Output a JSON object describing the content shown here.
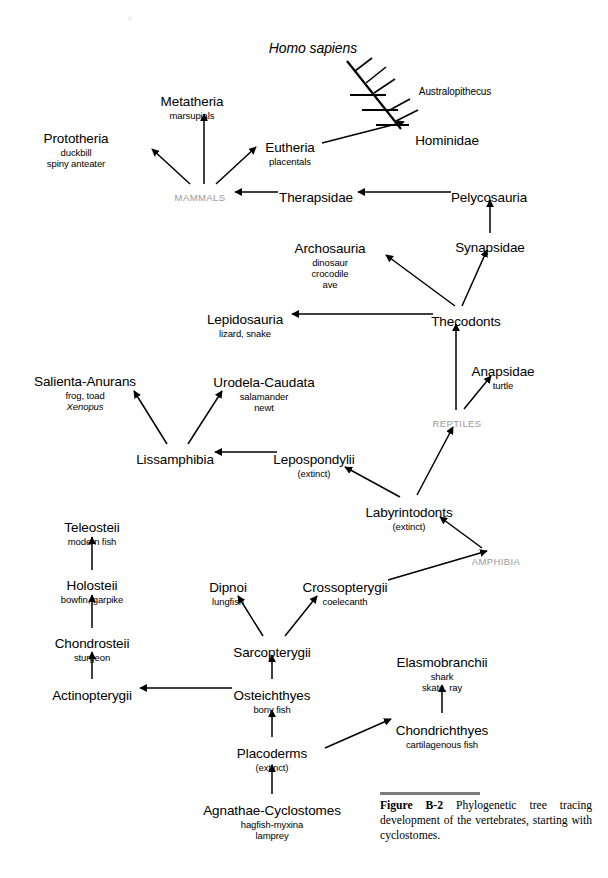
{
  "figure": {
    "label": "Figure",
    "number": "B-2",
    "caption": "Phylogenetic tree tracing development of the vertebrates, starting with cyclostomes."
  },
  "nodes": [
    {
      "id": "homo_sapiens",
      "taxon": "Homo sapiens",
      "common": "",
      "italic_taxon": true,
      "x": 313,
      "y": 40,
      "kind": "sci"
    },
    {
      "id": "australopithecus",
      "taxon": "Australopithecus",
      "common": "",
      "x": 455,
      "y": 86,
      "kind": "small"
    },
    {
      "id": "hominidae",
      "taxon": "Hominidae",
      "common": "",
      "x": 447,
      "y": 133
    },
    {
      "id": "metatheria",
      "taxon": "Metatheria",
      "common": "marsupials",
      "x": 192,
      "y": 94
    },
    {
      "id": "prototheria",
      "taxon": "Prototheria",
      "common": "duckbill\nspiny anteater",
      "x": 76,
      "y": 131
    },
    {
      "id": "eutheria",
      "taxon": "Eutheria",
      "common": "placentals",
      "x": 290,
      "y": 140
    },
    {
      "id": "mammals",
      "taxon": "MAMMALS",
      "common": "",
      "x": 200,
      "y": 192,
      "kind": "group"
    },
    {
      "id": "therapsidae",
      "taxon": "Therapsidae",
      "common": "",
      "x": 316,
      "y": 190
    },
    {
      "id": "pelycosauria",
      "taxon": "Pelycosauria",
      "common": "",
      "x": 489,
      "y": 190
    },
    {
      "id": "synapsidae",
      "taxon": "Synapsidae",
      "common": "",
      "x": 490,
      "y": 240
    },
    {
      "id": "archosauria",
      "taxon": "Archosauria",
      "common": "dinosaur\ncrocodile\nave",
      "x": 330,
      "y": 241
    },
    {
      "id": "thecodonts",
      "taxon": "Thecodonts",
      "common": "",
      "x": 466,
      "y": 314
    },
    {
      "id": "lepidosauria",
      "taxon": "Lepidosauria",
      "common": "lizard, snake",
      "x": 245,
      "y": 312
    },
    {
      "id": "anapsidae",
      "taxon": "Anapsidae",
      "common": "turtle",
      "x": 503,
      "y": 364
    },
    {
      "id": "reptiles",
      "taxon": "REPTILES",
      "common": "",
      "x": 457,
      "y": 418,
      "kind": "group"
    },
    {
      "id": "salienta",
      "taxon": "Salienta-Anurans",
      "common": "frog, toad",
      "common2": "Xenopus",
      "common2_italic": true,
      "x": 85,
      "y": 374
    },
    {
      "id": "urodela",
      "taxon": "Urodela-Caudata",
      "common": "salamander\nnewt",
      "x": 264,
      "y": 375
    },
    {
      "id": "lissamphibia",
      "taxon": "Lissamphibia",
      "common": "",
      "x": 175,
      "y": 452
    },
    {
      "id": "lepospondylii",
      "taxon": "Lepospondylii",
      "common": "(extinct)",
      "x": 314,
      "y": 452
    },
    {
      "id": "labyrintodonts",
      "taxon": "Labyrintodonts",
      "common": "(extinct)",
      "x": 409,
      "y": 505
    },
    {
      "id": "amphibia",
      "taxon": "AMPHIBIA",
      "common": "",
      "x": 496,
      "y": 556,
      "kind": "group"
    },
    {
      "id": "teleosteii",
      "taxon": "Teleosteii",
      "common": "modern fish",
      "x": 92,
      "y": 520
    },
    {
      "id": "holosteii",
      "taxon": "Holosteii",
      "common": "bowfin, garpike",
      "x": 92,
      "y": 578
    },
    {
      "id": "chondrosteii",
      "taxon": "Chondrosteii",
      "common": "sturgeon",
      "x": 92,
      "y": 636
    },
    {
      "id": "actinopterygii",
      "taxon": "Actinopterygii",
      "common": "",
      "x": 92,
      "y": 688
    },
    {
      "id": "dipnoi",
      "taxon": "Dipnoi",
      "common": "lungfish",
      "x": 228,
      "y": 580
    },
    {
      "id": "crossopterygii",
      "taxon": "Crossopterygii",
      "common": "coelecanth",
      "x": 345,
      "y": 580
    },
    {
      "id": "sarcopterygii",
      "taxon": "Sarcopterygii",
      "common": "",
      "x": 272,
      "y": 645
    },
    {
      "id": "osteichthyes",
      "taxon": "Osteichthyes",
      "common": "bony fish",
      "x": 272,
      "y": 688
    },
    {
      "id": "elasmobranchii",
      "taxon": "Elasmobranchii",
      "common": "shark\nskate, ray",
      "x": 442,
      "y": 655
    },
    {
      "id": "chondrichthyes",
      "taxon": "Chondrichthyes",
      "common": "cartilagenous fish",
      "x": 442,
      "y": 723
    },
    {
      "id": "placoderms",
      "taxon": "Placoderms",
      "common": "(extinct)",
      "x": 272,
      "y": 746
    },
    {
      "id": "agnathae",
      "taxon": "Agnathae-Cyclostomes",
      "common": "hagfish-myxina\nlamprey",
      "x": 272,
      "y": 803
    }
  ],
  "edges": [
    {
      "name": "mammals-to-prototheria",
      "from": "mammals",
      "to": "prototheria",
      "x1": 190,
      "y1": 184,
      "x2": 152,
      "y2": 149
    },
    {
      "name": "mammals-to-metatheria",
      "from": "mammals",
      "to": "metatheria",
      "x1": 204,
      "y1": 184,
      "x2": 204,
      "y2": 114
    },
    {
      "name": "mammals-to-eutheria",
      "from": "mammals",
      "to": "eutheria",
      "x1": 216,
      "y1": 184,
      "x2": 256,
      "y2": 147
    },
    {
      "name": "therapsidae-to-mammals",
      "from": "therapsidae",
      "to": "mammals",
      "x1": 278,
      "y1": 192,
      "x2": 235,
      "y2": 192
    },
    {
      "name": "pelycosauria-to-therapsidae",
      "from": "pelycosauria",
      "to": "therapsidae",
      "x1": 451,
      "y1": 192,
      "x2": 358,
      "y2": 192
    },
    {
      "name": "eutheria-to-hominidae",
      "from": "eutheria",
      "to": "hominidae",
      "x1": 322,
      "y1": 143,
      "x2": 404,
      "y2": 122
    },
    {
      "name": "synapsidae-to-pelycosauria",
      "from": "synapsidae",
      "to": "pelycosauria",
      "x1": 490,
      "y1": 233,
      "x2": 490,
      "y2": 200
    },
    {
      "name": "thecodonts-to-synapsidae",
      "from": "thecodonts",
      "to": "synapsidae",
      "x1": 462,
      "y1": 306,
      "x2": 487,
      "y2": 250
    },
    {
      "name": "thecodonts-to-archosauria",
      "from": "thecodonts",
      "to": "archosauria",
      "x1": 455,
      "y1": 306,
      "x2": 386,
      "y2": 255
    },
    {
      "name": "thecodonts-to-lepidosauria",
      "from": "thecodonts",
      "to": "lepidosauria",
      "x1": 433,
      "y1": 314,
      "x2": 292,
      "y2": 314
    },
    {
      "name": "reptiles-to-thecodonts",
      "from": "reptiles",
      "to": "thecodonts",
      "x1": 456,
      "y1": 410,
      "x2": 456,
      "y2": 324
    },
    {
      "name": "reptiles-to-anapsidae",
      "from": "reptiles",
      "to": "anapsidae",
      "x1": 464,
      "y1": 409,
      "x2": 491,
      "y2": 376
    },
    {
      "name": "labyrintodonts-to-reptiles",
      "from": "labyrintodonts",
      "to": "reptiles",
      "x1": 417,
      "y1": 495,
      "x2": 453,
      "y2": 427
    },
    {
      "name": "labyrintodonts-to-lepospondylii",
      "from": "labyrintodonts",
      "to": "lepospondylii",
      "x1": 400,
      "y1": 497,
      "x2": 345,
      "y2": 467
    },
    {
      "name": "lepospondylii-to-lissamphibia",
      "from": "lepospondylii",
      "to": "lissamphibia",
      "x1": 277,
      "y1": 452,
      "x2": 215,
      "y2": 452
    },
    {
      "name": "lissamphibia-to-salienta",
      "from": "lissamphibia",
      "to": "salienta",
      "x1": 167,
      "y1": 444,
      "x2": 134,
      "y2": 391
    },
    {
      "name": "lissamphibia-to-urodela",
      "from": "lissamphibia",
      "to": "urodela",
      "x1": 188,
      "y1": 444,
      "x2": 222,
      "y2": 391
    },
    {
      "name": "amphibia-to-labyrintodonts",
      "from": "amphibia",
      "to": "labyrintodonts",
      "x1": 482,
      "y1": 548,
      "x2": 440,
      "y2": 517
    },
    {
      "name": "crossopterygii-to-amphibia",
      "from": "crossopterygii",
      "to": "amphibia",
      "x1": 388,
      "y1": 580,
      "x2": 487,
      "y2": 551
    },
    {
      "name": "sarcopterygii-to-dipnoi",
      "from": "sarcopterygii",
      "to": "dipnoi",
      "x1": 263,
      "y1": 636,
      "x2": 238,
      "y2": 596
    },
    {
      "name": "sarcopterygii-to-crossopterygii",
      "from": "sarcopterygii",
      "to": "crossopterygii",
      "x1": 285,
      "y1": 636,
      "x2": 317,
      "y2": 596
    },
    {
      "name": "osteichthyes-to-sarcopterygii",
      "from": "osteichthyes",
      "to": "sarcopterygii",
      "x1": 272,
      "y1": 679,
      "x2": 272,
      "y2": 655
    },
    {
      "name": "osteichthyes-to-actinopterygii",
      "from": "osteichthyes",
      "to": "actinopterygii",
      "x1": 232,
      "y1": 688,
      "x2": 140,
      "y2": 688
    },
    {
      "name": "actinopterygii-to-chondrosteii",
      "from": "actinopterygii",
      "to": "chondrosteii",
      "x1": 92,
      "y1": 679,
      "x2": 92,
      "y2": 652
    },
    {
      "name": "chondrosteii-to-holosteii",
      "from": "chondrosteii",
      "to": "holosteii",
      "x1": 92,
      "y1": 628,
      "x2": 92,
      "y2": 595
    },
    {
      "name": "holosteii-to-teleosteii",
      "from": "holosteii",
      "to": "teleosteii",
      "x1": 92,
      "y1": 570,
      "x2": 92,
      "y2": 537
    },
    {
      "name": "placoderms-to-osteichthyes",
      "from": "placoderms",
      "to": "osteichthyes",
      "x1": 272,
      "y1": 737,
      "x2": 272,
      "y2": 710
    },
    {
      "name": "placoderms-to-chondrichthyes",
      "from": "placoderms",
      "to": "chondrichthyes",
      "x1": 325,
      "y1": 748,
      "x2": 391,
      "y2": 719
    },
    {
      "name": "chondrichthyes-to-elasmobranchii",
      "from": "chondrichthyes",
      "to": "elasmobranchii",
      "x1": 442,
      "y1": 713,
      "x2": 442,
      "y2": 685
    },
    {
      "name": "agnathae-to-placoderms",
      "from": "agnathae",
      "to": "placoderms",
      "x1": 272,
      "y1": 794,
      "x2": 272,
      "y2": 765
    }
  ],
  "cladogram": {
    "name": "hominid-cladogram",
    "trunk": {
      "x1": 401,
      "y1": 129,
      "x2": 347,
      "y2": 61
    },
    "branches": [
      {
        "type": "horizontal",
        "x1": 350,
        "y1": 95,
        "x2": 386,
        "y2": 95
      },
      {
        "type": "horizontal",
        "x1": 362,
        "y1": 110,
        "x2": 398,
        "y2": 110
      },
      {
        "type": "horizontal",
        "x1": 376,
        "y1": 125,
        "x2": 409,
        "y2": 125
      },
      {
        "type": "diagonal",
        "x1": 366,
        "y1": 83,
        "x2": 386,
        "y2": 67
      },
      {
        "type": "diagonal",
        "x1": 374,
        "y1": 93,
        "x2": 395,
        "y2": 79
      },
      {
        "type": "diagonal",
        "x1": 388,
        "y1": 111,
        "x2": 410,
        "y2": 99
      },
      {
        "type": "diagonal",
        "x1": 396,
        "y1": 121,
        "x2": 418,
        "y2": 110
      },
      {
        "type": "diagonal",
        "x1": 355,
        "y1": 71,
        "x2": 372,
        "y2": 58
      }
    ]
  },
  "colors": {
    "line": "#000000",
    "text": "#000000",
    "group_label": "#9a9a9a",
    "caption_rule": "#7c7c7c",
    "background": "#ffffff"
  }
}
